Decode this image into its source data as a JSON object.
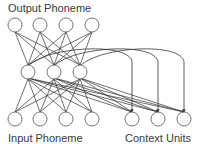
{
  "labels": {
    "output": "Output Phoneme",
    "input": "Input Phoneme",
    "context": "Context Units"
  },
  "style": {
    "node_stroke": "#666666",
    "edge_color": "#333333",
    "node_fill": "#ffffff"
  },
  "layers": {
    "output": {
      "name": "Output Phoneme",
      "y": 25,
      "x": [
        15,
        40,
        66,
        92
      ]
    },
    "hidden": {
      "name": "Hidden",
      "y": 72,
      "x": [
        28,
        54,
        80
      ]
    },
    "input": {
      "name": "Input Phoneme",
      "y": 119,
      "x": [
        15,
        40,
        66,
        92
      ]
    },
    "context": {
      "name": "Context Units",
      "y": 119,
      "x": [
        132,
        158,
        184
      ]
    }
  },
  "node_radius": 7,
  "connections": [
    {
      "from": "input",
      "to": "hidden",
      "type": "full"
    },
    {
      "from": "hidden",
      "to": "output",
      "type": "full"
    },
    {
      "from": "context",
      "to": "hidden",
      "type": "full"
    },
    {
      "from": "hidden",
      "to": "context",
      "type": "one-to-one-recurrent-copy",
      "arrow": true
    }
  ]
}
